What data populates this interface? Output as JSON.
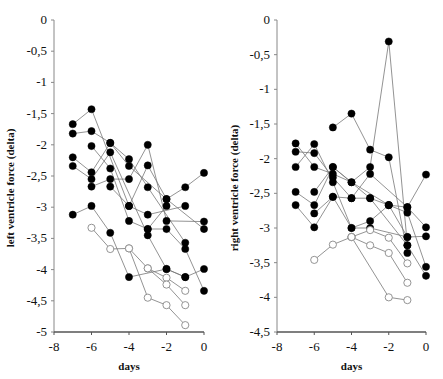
{
  "chart_data": [
    {
      "type": "line",
      "title": "",
      "xlabel": "days",
      "ylabel": "left ventricle force (delta)",
      "xlim": [
        -8,
        0
      ],
      "ylim": [
        -5,
        0
      ],
      "xticks": [
        -8,
        -6,
        -4,
        -2,
        0
      ],
      "xtick_labels": [
        "-8",
        "-6",
        "-4",
        "-2",
        "0"
      ],
      "yticks": [
        0,
        -0.5,
        -1,
        -1.5,
        -2,
        -2.5,
        -3,
        -3.5,
        -4,
        -4.5,
        -5
      ],
      "ytick_labels": [
        "0",
        "-0,5",
        "-1",
        "-1,5",
        "-2",
        "-2,5",
        "-3",
        "-3,5",
        "-4",
        "-4,5",
        "-5"
      ],
      "grid": false,
      "legend": null,
      "series": [
        {
          "name": "filled-1",
          "marker": "filled",
          "x": [
            -7,
            -6,
            -4,
            -3,
            -1
          ],
          "y": [
            -1.67,
            -1.43,
            -2.98,
            -3.12,
            -2.98
          ]
        },
        {
          "name": "filled-2",
          "marker": "filled",
          "x": [
            -7,
            -6,
            -5,
            -4,
            -2,
            0
          ],
          "y": [
            -1.82,
            -1.78,
            -1.97,
            -2.34,
            -2.87,
            -3.35
          ]
        },
        {
          "name": "filled-3",
          "marker": "filled",
          "x": [
            -6,
            -5,
            -4,
            -3,
            -2
          ],
          "y": [
            -2.02,
            -2.38,
            -3.22,
            -3.35,
            -2.98
          ]
        },
        {
          "name": "filled-4",
          "marker": "filled",
          "x": [
            -7,
            -6,
            -5,
            -4,
            -3,
            -1
          ],
          "y": [
            -2.2,
            -2.44,
            -1.97,
            -2.23,
            -2.68,
            -3.57
          ]
        },
        {
          "name": "filled-5",
          "marker": "filled",
          "x": [
            -7,
            -6,
            -5,
            -3,
            -2,
            -1
          ],
          "y": [
            -2.34,
            -2.55,
            -2.12,
            -3.45,
            -3.99,
            -4.12
          ]
        },
        {
          "name": "filled-6",
          "marker": "filled",
          "x": [
            -6,
            -5,
            -4,
            -3,
            -2,
            0
          ],
          "y": [
            -2.67,
            -2.55,
            -2.55,
            -2.0,
            -3.22,
            -3.23
          ]
        },
        {
          "name": "filled-7",
          "marker": "filled",
          "x": [
            -5,
            -4,
            -3,
            -2,
            -1,
            0
          ],
          "y": [
            -2.67,
            -2.98,
            -2.33,
            -2.87,
            -2.68,
            -2.45
          ]
        },
        {
          "name": "filled-8",
          "marker": "filled",
          "x": [
            -7,
            -6,
            -5,
            -4,
            -2,
            -1,
            0
          ],
          "y": [
            -3.12,
            -2.98,
            -3.41,
            -4.12,
            -3.99,
            -4.12,
            -3.99
          ]
        },
        {
          "name": "filled-9",
          "marker": "filled",
          "x": [
            -3,
            -2,
            -1,
            0
          ],
          "y": [
            -3.35,
            -3.35,
            -3.67,
            -4.34
          ]
        },
        {
          "name": "open-1",
          "marker": "open",
          "x": [
            -6,
            -5,
            -4,
            -3,
            -2,
            -1
          ],
          "y": [
            -3.33,
            -3.67,
            -3.66,
            -3.98,
            -4.13,
            -4.34
          ]
        },
        {
          "name": "open-2",
          "marker": "open",
          "x": [
            -4,
            -3,
            -2,
            -1
          ],
          "y": [
            -3.66,
            -4.45,
            -4.57,
            -4.89
          ]
        },
        {
          "name": "open-3",
          "marker": "open",
          "x": [
            -3,
            -2,
            -1
          ],
          "y": [
            -3.98,
            -4.24,
            -4.57
          ]
        }
      ]
    },
    {
      "type": "line",
      "title": "",
      "xlabel": "days",
      "ylabel": "right ventricle force (delta)",
      "xlim": [
        -8,
        0
      ],
      "ylim": [
        -4.5,
        0
      ],
      "xticks": [
        -8,
        -6,
        -4,
        -2,
        0
      ],
      "xtick_labels": [
        "-8",
        "-6",
        "-4",
        "-2",
        "0"
      ],
      "yticks": [
        0,
        -0.5,
        -1,
        -1.5,
        -2,
        -2.5,
        -3,
        -3.5,
        -4,
        -4.5
      ],
      "ytick_labels": [
        "0",
        "-0,5",
        "-1",
        "-1,5",
        "-2",
        "-2,5",
        "-3",
        "-3,5",
        "-4",
        "-4,5"
      ],
      "grid": false,
      "legend": null,
      "series": [
        {
          "name": "filled-1",
          "marker": "filled",
          "x": [
            -5,
            -4,
            -3,
            -2,
            -1
          ],
          "y": [
            -1.55,
            -1.35,
            -1.87,
            -1.98,
            -3.36
          ]
        },
        {
          "name": "filled-2",
          "marker": "filled",
          "x": [
            -7,
            -6,
            -5,
            -4,
            -3,
            -2,
            -1
          ],
          "y": [
            -1.78,
            -2.12,
            -2.22,
            -2.34,
            -2.12,
            -0.31,
            -3.25
          ]
        },
        {
          "name": "filled-3",
          "marker": "filled",
          "x": [
            -7,
            -6,
            -5,
            -4,
            -3,
            -1,
            0
          ],
          "y": [
            -1.9,
            -1.92,
            -2.27,
            -2.57,
            -2.22,
            -2.7,
            -2.99
          ]
        },
        {
          "name": "filled-4",
          "marker": "filled",
          "x": [
            -7,
            -6,
            -5,
            -4,
            -3,
            -2,
            -1
          ],
          "y": [
            -2.12,
            -1.79,
            -2.34,
            -3.0,
            -2.9,
            -2.67,
            -3.13
          ]
        },
        {
          "name": "filled-5",
          "marker": "filled",
          "x": [
            -7,
            -6,
            -5,
            -3,
            -2,
            -1,
            0
          ],
          "y": [
            -2.48,
            -2.67,
            -2.12,
            -2.57,
            -2.67,
            -2.78,
            -3.56
          ]
        },
        {
          "name": "filled-6",
          "marker": "filled",
          "x": [
            -7,
            -6,
            -5,
            -4,
            -3,
            -1,
            0
          ],
          "y": [
            -2.67,
            -2.99,
            -2.55,
            -3.0,
            -3.0,
            -3.13,
            -3.12
          ]
        },
        {
          "name": "filled-7",
          "marker": "filled",
          "x": [
            -6,
            -5,
            -4,
            -2,
            -1,
            0
          ],
          "y": [
            -2.48,
            -2.12,
            -2.34,
            -2.67,
            -2.7,
            -2.23
          ]
        },
        {
          "name": "filled-8",
          "marker": "filled",
          "x": [
            -6,
            -5,
            -4,
            -3,
            -1,
            0
          ],
          "y": [
            -2.79,
            -2.55,
            -2.57,
            -2.57,
            -3.25,
            -3.69
          ]
        },
        {
          "name": "open-1",
          "marker": "open",
          "x": [
            -6,
            -5,
            -4,
            -3,
            -2,
            -1
          ],
          "y": [
            -3.46,
            -3.24,
            -3.13,
            -3.03,
            -3.14,
            -3.51
          ]
        },
        {
          "name": "open-2",
          "marker": "open",
          "x": [
            -4,
            -3,
            -2,
            -1
          ],
          "y": [
            -3.13,
            -3.25,
            -3.36,
            -3.79
          ]
        },
        {
          "name": "open-3",
          "marker": "open",
          "x": [
            -4,
            -2,
            -1
          ],
          "y": [
            -3.13,
            -4.0,
            -4.04
          ]
        }
      ]
    }
  ]
}
